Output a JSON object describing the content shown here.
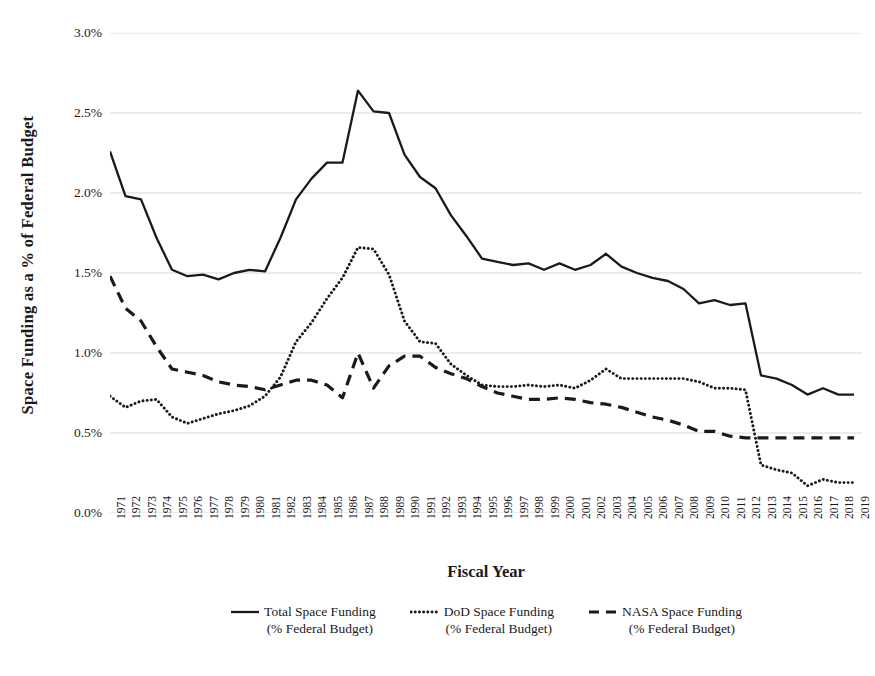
{
  "chart_data": {
    "type": "line",
    "title": "",
    "xlabel": "Fiscal Year",
    "ylabel": "Space Funding as a % of Federal Budget",
    "ylim": [
      0,
      3.0
    ],
    "yticks": [
      "0.0%",
      "0.5%",
      "1.0%",
      "1.5%",
      "2.0%",
      "2.5%",
      "3.0%"
    ],
    "ytick_values": [
      0.0,
      0.5,
      1.0,
      1.5,
      2.0,
      2.5,
      3.0
    ],
    "grid": "horizontal",
    "legend_position": "bottom",
    "categories": [
      "1971",
      "1972",
      "1973",
      "1974",
      "1975",
      "1976",
      "1977",
      "1978",
      "1979",
      "1980",
      "1981",
      "1982",
      "1983",
      "1984",
      "1985",
      "1986",
      "1987",
      "1988",
      "1989",
      "1990",
      "1991",
      "1992",
      "1993",
      "1994",
      "1995",
      "1996",
      "1997",
      "1998",
      "1999",
      "2000",
      "2001",
      "2002",
      "2003",
      "2004",
      "2005",
      "2006",
      "2007",
      "2008",
      "2009",
      "2010",
      "2011",
      "2012",
      "2013",
      "2014",
      "2015",
      "2016",
      "2017",
      "2018",
      "2019"
    ],
    "series": [
      {
        "name": "Total Space Funding (% Federal Budget)",
        "style": "solid",
        "color": "#1a1a1a",
        "values": [
          2.26,
          1.98,
          1.96,
          1.72,
          1.52,
          1.48,
          1.49,
          1.46,
          1.5,
          1.52,
          1.51,
          1.72,
          1.96,
          2.09,
          2.19,
          2.19,
          2.64,
          2.51,
          2.5,
          2.24,
          2.1,
          2.03,
          1.86,
          1.73,
          1.59,
          1.57,
          1.55,
          1.56,
          1.52,
          1.56,
          1.52,
          1.55,
          1.62,
          1.54,
          1.5,
          1.47,
          1.45,
          1.4,
          1.31,
          1.33,
          1.3,
          1.31,
          0.86,
          0.84,
          0.8,
          0.74,
          0.78,
          0.74,
          0.74
        ]
      },
      {
        "name": "DoD Space Funding (% Federal Budget)",
        "style": "dotted",
        "color": "#1a1a1a",
        "values": [
          0.73,
          0.66,
          0.7,
          0.71,
          0.6,
          0.56,
          0.59,
          0.62,
          0.64,
          0.67,
          0.73,
          0.85,
          1.07,
          1.19,
          1.34,
          1.47,
          1.66,
          1.65,
          1.49,
          1.2,
          1.07,
          1.06,
          0.93,
          0.86,
          0.8,
          0.79,
          0.79,
          0.8,
          0.79,
          0.8,
          0.78,
          0.83,
          0.9,
          0.84,
          0.84,
          0.84,
          0.84,
          0.84,
          0.82,
          0.78,
          0.78,
          0.77,
          0.3,
          0.27,
          0.25,
          0.17,
          0.21,
          0.19,
          0.19
        ]
      },
      {
        "name": "NASA Space Funding (% Federal Budget)",
        "style": "dashed",
        "color": "#1a1a1a",
        "values": [
          1.48,
          1.28,
          1.2,
          1.04,
          0.9,
          0.88,
          0.86,
          0.82,
          0.8,
          0.79,
          0.77,
          0.8,
          0.83,
          0.83,
          0.8,
          0.72,
          1.0,
          0.78,
          0.92,
          0.98,
          0.98,
          0.91,
          0.87,
          0.84,
          0.79,
          0.75,
          0.73,
          0.71,
          0.71,
          0.72,
          0.71,
          0.69,
          0.68,
          0.66,
          0.63,
          0.6,
          0.58,
          0.55,
          0.51,
          0.51,
          0.48,
          0.47,
          0.47,
          0.47,
          0.47,
          0.47,
          0.47,
          0.47,
          0.47
        ]
      }
    ]
  },
  "axis": {
    "y_title": "Space Funding as a % of Federal Budget",
    "x_title": "Fiscal Year"
  },
  "legend": {
    "items": [
      {
        "line1": "Total Space Funding",
        "line2": "(% Federal Budget)",
        "style": "solid"
      },
      {
        "line1": "DoD Space Funding",
        "line2": "(% Federal Budget)",
        "style": "dotted"
      },
      {
        "line1": "NASA Space Funding",
        "line2": "(% Federal Budget)",
        "style": "dashed"
      }
    ]
  }
}
